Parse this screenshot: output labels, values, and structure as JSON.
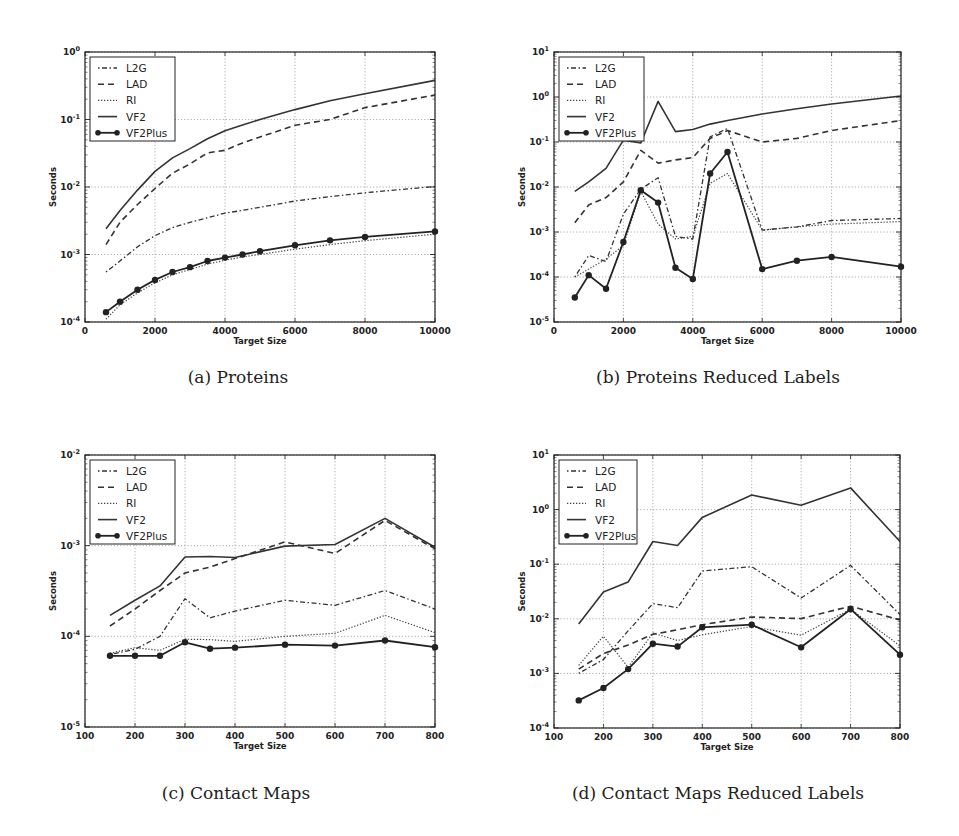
{
  "figure": {
    "captions": {
      "a": "(a) Proteins",
      "b": "(b) Proteins Reduced Labels",
      "c": "(c) Contact Maps",
      "d": "(d) Contact Maps Reduced Labels"
    }
  },
  "legend": [
    "L2G",
    "LAD",
    "RI",
    "VF2",
    "VF2Plus"
  ],
  "chart_data": [
    {
      "id": "a",
      "type": "line",
      "title": "(a) Proteins",
      "xlabel": "Target Size",
      "ylabel": "Seconds",
      "yscale": "log",
      "xlim": [
        0,
        10000
      ],
      "ylim": [
        0.0001,
        1
      ],
      "xticks": [
        0,
        2000,
        4000,
        6000,
        8000,
        10000
      ],
      "yticks": [
        "10^-4",
        "10^-3",
        "10^-2",
        "10^-1",
        "10^0"
      ],
      "grid": true,
      "legend_position": "upper left",
      "x": [
        600,
        1000,
        1500,
        2000,
        2500,
        3000,
        3500,
        4000,
        4500,
        5000,
        6000,
        7000,
        8000,
        10000
      ],
      "series": [
        {
          "name": "L2G",
          "values": [
            0.00055,
            0.0008,
            0.0013,
            0.0019,
            0.0025,
            0.003,
            0.0035,
            0.0041,
            0.0045,
            0.005,
            0.0062,
            0.0072,
            0.0082,
            0.0102
          ]
        },
        {
          "name": "LAD",
          "values": [
            0.0014,
            0.003,
            0.0055,
            0.0095,
            0.016,
            0.022,
            0.032,
            0.035,
            0.045,
            0.055,
            0.082,
            0.1,
            0.15,
            0.23
          ]
        },
        {
          "name": "RI",
          "values": [
            0.00011,
            0.00018,
            0.00027,
            0.00038,
            0.0005,
            0.0006,
            0.00072,
            0.00082,
            0.00092,
            0.001,
            0.0012,
            0.0014,
            0.0016,
            0.002
          ]
        },
        {
          "name": "VF2",
          "values": [
            0.0024,
            0.0045,
            0.009,
            0.017,
            0.027,
            0.037,
            0.052,
            0.068,
            0.083,
            0.1,
            0.14,
            0.19,
            0.24,
            0.38
          ]
        },
        {
          "name": "VF2Plus",
          "values": [
            0.00014,
            0.0002,
            0.0003,
            0.00042,
            0.00055,
            0.00065,
            0.0008,
            0.0009,
            0.001,
            0.00112,
            0.00137,
            0.00162,
            0.00182,
            0.0022
          ]
        }
      ]
    },
    {
      "id": "b",
      "type": "line",
      "title": "(b) Proteins Reduced Labels",
      "xlabel": "Target Size",
      "ylabel": "Seconds",
      "yscale": "log",
      "xlim": [
        0,
        10000
      ],
      "ylim": [
        1e-05,
        10
      ],
      "xticks": [
        0,
        2000,
        4000,
        6000,
        8000,
        10000
      ],
      "yticks": [
        "10^-5",
        "10^-4",
        "10^-3",
        "10^-2",
        "10^-1",
        "10^0",
        "10^1"
      ],
      "grid": true,
      "legend_position": "upper left",
      "x": [
        600,
        1000,
        1500,
        2000,
        2500,
        3000,
        3500,
        4000,
        4500,
        5000,
        6000,
        7000,
        8000,
        10000
      ],
      "series": [
        {
          "name": "L2G",
          "values": [
            0.0001,
            0.0003,
            0.00022,
            0.0025,
            0.009,
            0.016,
            0.0008,
            0.0007,
            0.13,
            0.2,
            0.0011,
            0.0013,
            0.0018,
            0.002
          ]
        },
        {
          "name": "LAD",
          "values": [
            0.0016,
            0.004,
            0.0058,
            0.013,
            0.065,
            0.034,
            0.04,
            0.045,
            0.12,
            0.18,
            0.1,
            0.12,
            0.18,
            0.3
          ]
        },
        {
          "name": "RI",
          "values": [
            0.0001,
            0.00015,
            0.00025,
            0.0005,
            0.008,
            0.0015,
            0.0007,
            0.0008,
            0.012,
            0.02,
            0.0011,
            0.0013,
            0.0015,
            0.0017
          ]
        },
        {
          "name": "VF2",
          "values": [
            0.008,
            0.013,
            0.026,
            0.11,
            0.095,
            0.8,
            0.17,
            0.19,
            0.25,
            0.3,
            0.42,
            0.55,
            0.7,
            1.05
          ]
        },
        {
          "name": "VF2Plus",
          "values": [
            3.5e-05,
            0.00011,
            5.5e-05,
            0.0006,
            0.0085,
            0.0045,
            0.00016,
            9e-05,
            0.02,
            0.06,
            0.00015,
            0.00023,
            0.00028,
            0.00017
          ]
        }
      ]
    },
    {
      "id": "c",
      "type": "line",
      "title": "(c) Contact Maps",
      "xlabel": "Target Size",
      "ylabel": "Seconds",
      "yscale": "log",
      "xlim": [
        100,
        800
      ],
      "ylim": [
        1e-05,
        0.01
      ],
      "xticks": [
        100,
        200,
        300,
        400,
        500,
        600,
        700,
        800
      ],
      "yticks": [
        "10^-5",
        "10^-4",
        "10^-3",
        "10^-2"
      ],
      "grid": true,
      "legend_position": "upper left",
      "x": [
        150,
        200,
        250,
        300,
        350,
        400,
        500,
        600,
        700,
        800
      ],
      "series": [
        {
          "name": "L2G",
          "values": [
            6.3e-05,
            7.2e-05,
            0.0001,
            0.00026,
            0.00016,
            0.00019,
            0.00025,
            0.00022,
            0.00032,
            0.0002
          ]
        },
        {
          "name": "LAD",
          "values": [
            0.00013,
            0.0002,
            0.00032,
            0.0005,
            0.00058,
            0.00072,
            0.0011,
            0.00082,
            0.0019,
            0.00092
          ]
        },
        {
          "name": "RI",
          "values": [
            6.5e-05,
            7.5e-05,
            7e-05,
            9.3e-05,
            9.2e-05,
            8.8e-05,
            0.0001,
            0.000108,
            0.00017,
            0.00011
          ]
        },
        {
          "name": "VF2",
          "values": [
            0.00017,
            0.00025,
            0.00036,
            0.00075,
            0.00076,
            0.00074,
            0.00099,
            0.00103,
            0.002,
            0.00096
          ]
        },
        {
          "name": "VF2Plus",
          "values": [
            6.1e-05,
            6.1e-05,
            6.1e-05,
            8.6e-05,
            7.3e-05,
            7.5e-05,
            8.1e-05,
            7.9e-05,
            9e-05,
            7.6e-05
          ]
        }
      ]
    },
    {
      "id": "d",
      "type": "line",
      "title": "(d) Contact Maps Reduced Labels",
      "xlabel": "Target Size",
      "ylabel": "Seconds",
      "yscale": "log",
      "xlim": [
        100,
        800
      ],
      "ylim": [
        0.0001,
        10
      ],
      "xticks": [
        100,
        200,
        300,
        400,
        500,
        600,
        700,
        800
      ],
      "yticks": [
        "10^-4",
        "10^-3",
        "10^-2",
        "10^-1",
        "10^0",
        "10^1"
      ],
      "grid": true,
      "legend_position": "upper left",
      "x": [
        150,
        200,
        250,
        300,
        350,
        400,
        500,
        600,
        700,
        800
      ],
      "series": [
        {
          "name": "L2G",
          "values": [
            0.001,
            0.0018,
            0.006,
            0.019,
            0.016,
            0.075,
            0.09,
            0.024,
            0.095,
            0.012
          ]
        },
        {
          "name": "LAD",
          "values": [
            0.0012,
            0.0023,
            0.0033,
            0.0052,
            0.0063,
            0.0078,
            0.0108,
            0.0101,
            0.017,
            0.0095
          ]
        },
        {
          "name": "RI",
          "values": [
            0.0014,
            0.0048,
            0.0013,
            0.0055,
            0.004,
            0.0051,
            0.0072,
            0.005,
            0.015,
            0.0032
          ]
        },
        {
          "name": "VF2",
          "values": [
            0.008,
            0.031,
            0.047,
            0.26,
            0.22,
            0.72,
            1.85,
            1.2,
            2.5,
            0.26
          ]
        },
        {
          "name": "VF2Plus",
          "values": [
            0.00032,
            0.00054,
            0.0012,
            0.0035,
            0.0031,
            0.007,
            0.0078,
            0.003,
            0.015,
            0.0022
          ]
        }
      ]
    }
  ],
  "layout": {
    "a": {
      "left": 85,
      "top": 52,
      "right": 435,
      "bottom": 322,
      "legend_w": 85
    },
    "b": {
      "left": 554,
      "top": 52,
      "right": 901,
      "bottom": 322,
      "legend_w": 85
    },
    "c": {
      "left": 85,
      "top": 455,
      "right": 435,
      "bottom": 727,
      "legend_w": 85
    },
    "d": {
      "left": 554,
      "top": 455,
      "right": 900,
      "bottom": 728,
      "legend_w": 78
    }
  }
}
